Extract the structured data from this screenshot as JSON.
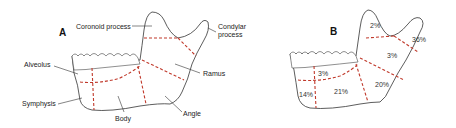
{
  "panels": [
    {
      "id": "A",
      "label": "A",
      "regions": [
        {
          "name": "Coronoid process"
        },
        {
          "name": "Condylar process"
        },
        {
          "name": "Alveolus"
        },
        {
          "name": "Ramus"
        },
        {
          "name": "Symphysis"
        },
        {
          "name": "Body"
        },
        {
          "name": "Angle"
        }
      ]
    },
    {
      "id": "B",
      "label": "B",
      "percentages": [
        {
          "region": "Coronoid process",
          "value": "2%"
        },
        {
          "region": "Condylar process",
          "value": "36%"
        },
        {
          "region": "Ramus",
          "value": "3%"
        },
        {
          "region": "Alveolus",
          "value": "3%"
        },
        {
          "region": "Angle",
          "value": "20%"
        },
        {
          "region": "Body",
          "value": "21%"
        },
        {
          "region": "Symphysis",
          "value": "14%"
        }
      ]
    }
  ],
  "colors": {
    "dash": "#c0392b",
    "outline": "#333333"
  }
}
